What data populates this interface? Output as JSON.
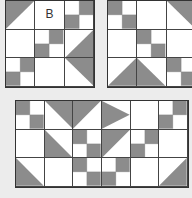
{
  "colors": {
    "gray": "#8c8c8c",
    "line": "#444444",
    "background": "#ececec"
  },
  "block_a": {
    "label": "B",
    "cols": 3,
    "rows": 3,
    "cells": [
      "tri-tl",
      "blank-label",
      "fp-tr-bl",
      "blank",
      "fp-tr-bl",
      "tri-br",
      "fp-tr-bl",
      "blank",
      "tri-tr"
    ]
  },
  "block_b": {
    "cols": 3,
    "rows": 3,
    "cells": [
      "fp-tl-br",
      "blank",
      "tri-tr",
      "blank",
      "fp-tl-br",
      "blank",
      "tri-br",
      "tri-bl",
      "fp-tl-br"
    ]
  },
  "block_c": {
    "cols": 6,
    "rows": 3,
    "cells": [
      "fp-tl-br",
      "tri-tr",
      "tri-tl",
      "tri-bl-top",
      "blank",
      "fp-tr-bl",
      "blank",
      "tri-tr-side",
      "fp-tl-br",
      "tri-tl-side",
      "fp-tr-bl",
      "blank",
      "tri-bl",
      "blank",
      "fp-tl-br",
      "fp-tr-bl",
      "blank",
      "tri-br"
    ]
  }
}
